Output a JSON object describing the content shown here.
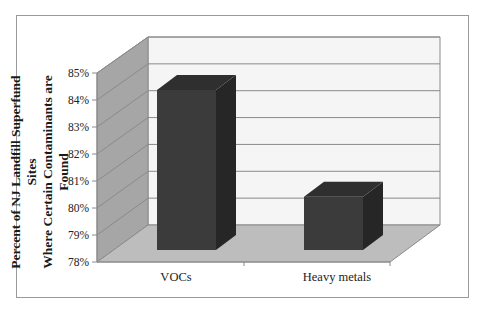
{
  "chart_data": {
    "type": "bar",
    "style": "3d-column",
    "title": "",
    "xlabel": "",
    "ylabel": "Percent of NJ Landfill Superfund Sites Where Certain Contaminants are Found",
    "ylabel_lines": [
      "Percent of NJ Landfill Superfund Sites",
      "Where Certain Contaminants are Found"
    ],
    "categories": [
      "VOCs",
      "Heavy metals"
    ],
    "values": [
      84,
      80
    ],
    "value_unit": "%",
    "ylim": [
      78,
      85
    ],
    "yticks": [
      "78%",
      "79%",
      "80%",
      "81%",
      "82%",
      "83%",
      "84%",
      "85%"
    ],
    "grid": true,
    "legend": null,
    "colors": {
      "bar_front": "#3b3b3b",
      "bar_top": "#2f2f2f",
      "bar_side": "#262626",
      "side_wall": "#a6a6a6",
      "floor": "#b8b8b8",
      "back_wall": "#f4f4f4",
      "gridline": "#8a8a8a"
    }
  }
}
